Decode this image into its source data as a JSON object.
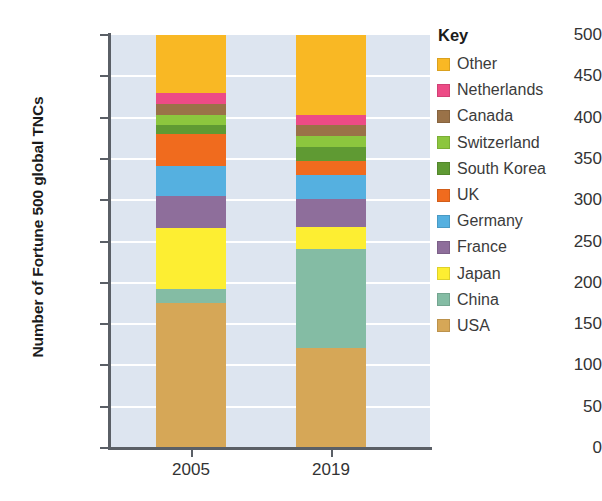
{
  "chart_data": {
    "type": "bar",
    "subtype": "stacked-bar",
    "title": "",
    "xlabel": "",
    "ylabel": "Number of Fortune 500 global TNCs",
    "categories": [
      "2005",
      "2019"
    ],
    "ylim": [
      0,
      500
    ],
    "yticks": [
      0,
      50,
      100,
      150,
      200,
      250,
      300,
      350,
      400,
      450,
      500
    ],
    "grid": true,
    "legend_position": "right",
    "legend_title": "Key",
    "stack_order_bottom_to_top": [
      "USA",
      "China",
      "Japan",
      "France",
      "Germany",
      "UK",
      "South Korea",
      "Switzerland",
      "Canada",
      "Netherlands",
      "Other"
    ],
    "series": [
      {
        "name": "USA",
        "color": "#d6a757",
        "values": [
          176,
          121
        ]
      },
      {
        "name": "China",
        "color": "#84bca4",
        "values": [
          16,
          120
        ]
      },
      {
        "name": "Japan",
        "color": "#fdee32",
        "values": [
          74,
          27
        ]
      },
      {
        "name": "France",
        "color": "#8e6e9b",
        "values": [
          39,
          34
        ]
      },
      {
        "name": "Germany",
        "color": "#55b0e0",
        "values": [
          37,
          29
        ]
      },
      {
        "name": "UK",
        "color": "#f06b1e",
        "values": [
          38,
          17
        ]
      },
      {
        "name": "South Korea",
        "color": "#5f9a33",
        "values": [
          11,
          16
        ]
      },
      {
        "name": "Switzerland",
        "color": "#8cc63e",
        "values": [
          12,
          14
        ]
      },
      {
        "name": "Canada",
        "color": "#9a7248",
        "values": [
          13,
          13
        ]
      },
      {
        "name": "Netherlands",
        "color": "#ed4b86",
        "values": [
          14,
          12
        ]
      },
      {
        "name": "Other",
        "color": "#f9b824",
        "values": [
          70,
          97
        ]
      }
    ]
  },
  "axis": {
    "y_title": "Number of Fortune 500 global TNCs",
    "y_tick_labels": [
      "500",
      "450",
      "400",
      "350",
      "300",
      "250",
      "200",
      "150",
      "100",
      "50",
      "0"
    ],
    "x_tick_labels": [
      "2005",
      "2019"
    ]
  },
  "legend": {
    "title": "Key",
    "items": [
      {
        "label": "Other",
        "color": "#f9b824"
      },
      {
        "label": "Netherlands",
        "color": "#ed4b86"
      },
      {
        "label": "Canada",
        "color": "#9a7248"
      },
      {
        "label": "Switzerland",
        "color": "#8cc63e"
      },
      {
        "label": "South Korea",
        "color": "#5f9a33"
      },
      {
        "label": "UK",
        "color": "#f06b1e"
      },
      {
        "label": "Germany",
        "color": "#55b0e0"
      },
      {
        "label": "France",
        "color": "#8e6e9b"
      },
      {
        "label": "Japan",
        "color": "#fdee32"
      },
      {
        "label": "China",
        "color": "#84bca4"
      },
      {
        "label": "USA",
        "color": "#d6a757"
      }
    ]
  },
  "style": {
    "plot_background": "#dde5f0",
    "gridline_color": "#ffffff",
    "axis_color": "#5a5f66",
    "text_color": "#333333"
  }
}
